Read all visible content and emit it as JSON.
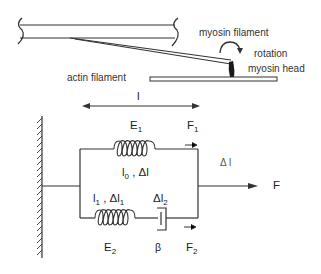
{
  "figure": {
    "type": "muscle cross-bridge mechanical model",
    "top_panel": {
      "labels": {
        "myosin_filament": "myosin filament",
        "rotation": "rotation",
        "myosin_head": "myosin head",
        "actin_filament": "actin filament",
        "length": "l"
      }
    },
    "bottom_panel": {
      "labels": {
        "E1": "E",
        "E1_sub": "1",
        "F1": "F",
        "F1_sub": "1",
        "delta_l": "Δ l",
        "l0": "l",
        "l0_sub": "0",
        "l0_rest": " , Δl",
        "l1": "l",
        "l1_sub": "1",
        "l1_rest": " , Δl",
        "l1_rest_sub": "1",
        "dl2": "Δl",
        "dl2_sub": "2",
        "F": "F",
        "E2": "E",
        "E2_sub": "2",
        "beta": "β",
        "F2": "F",
        "F2_sub": "2"
      }
    },
    "colors": {
      "line": "#333333",
      "background": "#ffffff",
      "head": "#1a1a1a"
    }
  }
}
